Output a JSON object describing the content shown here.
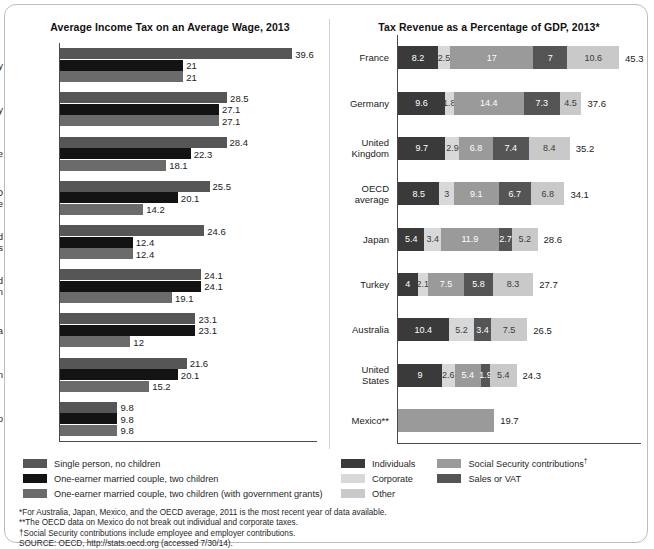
{
  "chart_data": [
    {
      "type": "bar",
      "title": "Average Income Tax on an Average Wage, 2013",
      "orientation": "horizontal",
      "xlabel": "",
      "ylabel": "",
      "xlim": [
        0,
        44
      ],
      "grid": false,
      "legend_position": "bottom-left",
      "categories": [
        "Germany",
        "Turkey",
        "France",
        "OECD\naverage",
        "United\nStates",
        "United\nKingdom",
        "Australia",
        "Japan",
        "Mexico"
      ],
      "series": [
        {
          "name": "Single person, no children",
          "color": "#565656",
          "values": [
            39.6,
            28.5,
            28.4,
            25.5,
            24.6,
            24.1,
            23.1,
            21.6,
            9.8
          ]
        },
        {
          "name": "One-earner married couple, two children",
          "color": "#131313",
          "values": [
            21,
            27.1,
            22.3,
            20.1,
            12.4,
            24.1,
            23.1,
            20.1,
            9.8
          ]
        },
        {
          "name": "One-earner married couple, two children (with government grants)",
          "color": "#6b6b6b",
          "values": [
            21,
            27.1,
            18.1,
            14.2,
            12.4,
            19.1,
            12,
            15.2,
            9.8
          ]
        }
      ],
      "value_labels": [
        [
          "39.6",
          "21",
          "21"
        ],
        [
          "28.5",
          "27.1",
          "27.1"
        ],
        [
          "28.4",
          "22.3",
          "18.1"
        ],
        [
          "25.5",
          "20.1",
          "14.2"
        ],
        [
          "24.6",
          "12.4",
          "12.4"
        ],
        [
          "24.1",
          "24.1",
          "19.1"
        ],
        [
          "23.1",
          "23.1",
          "12"
        ],
        [
          "21.6",
          "20.1",
          "15.2"
        ],
        [
          "9.8",
          "9.8",
          "9.8"
        ]
      ]
    },
    {
      "type": "bar",
      "subtype": "stacked",
      "title": "Tax Revenue as a Percentage of GDP, 2013*",
      "orientation": "horizontal",
      "xlabel": "",
      "ylabel": "",
      "xlim": [
        0,
        50
      ],
      "grid": false,
      "legend_position": "bottom-right",
      "categories": [
        "France",
        "Germany",
        "United\nKingdom",
        "OECD\naverage",
        "Japan",
        "Turkey",
        "Australia",
        "United\nStates",
        "Mexico**"
      ],
      "series": [
        {
          "name": "Individuals",
          "color": "#3a3a3a",
          "values": [
            8.2,
            9.6,
            9.7,
            8.5,
            5.4,
            4,
            10.4,
            9,
            null
          ]
        },
        {
          "name": "Corporate",
          "color": "#d8d8d8",
          "values": [
            2.5,
            1.8,
            2.9,
            3,
            3.4,
            2.1,
            5.2,
            2.6,
            null
          ]
        },
        {
          "name": "Social Security contributions",
          "color": "#9a9a9a",
          "values": [
            17,
            14.4,
            6.8,
            9.1,
            11.9,
            7.5,
            null,
            5.4,
            19.7
          ]
        },
        {
          "name": "Sales or VAT",
          "color": "#555555",
          "values": [
            7,
            7.3,
            7.4,
            6.7,
            2.7,
            5.8,
            3.4,
            1.9,
            null
          ]
        },
        {
          "name": "Other",
          "color": "#c9c9c9",
          "values": [
            10.6,
            4.5,
            8.4,
            6.8,
            5.2,
            8.3,
            7.5,
            5.4,
            null
          ]
        }
      ],
      "rows": [
        {
          "label": "France",
          "total": "45.3",
          "segments": [
            {
              "series": "Individuals",
              "value": 8.2,
              "label": "8.2",
              "color": "#3a3a3a",
              "text": "light"
            },
            {
              "series": "Corporate",
              "value": 2.5,
              "label": "2.5",
              "color": "#d8d8d8",
              "text": "dark"
            },
            {
              "series": "Social Security contributions",
              "value": 17,
              "label": "17",
              "color": "#9a9a9a",
              "text": "light"
            },
            {
              "series": "Sales or VAT",
              "value": 7,
              "label": "7",
              "color": "#555555",
              "text": "light"
            },
            {
              "series": "Other",
              "value": 10.6,
              "label": "10.6",
              "color": "#c9c9c9",
              "text": "dark"
            }
          ]
        },
        {
          "label": "Germany",
          "total": "37.6",
          "segments": [
            {
              "series": "Individuals",
              "value": 9.6,
              "label": "9.6",
              "color": "#3a3a3a",
              "text": "light"
            },
            {
              "series": "Corporate",
              "value": 1.8,
              "label": "1.8",
              "color": "#d8d8d8",
              "text": "dark"
            },
            {
              "series": "Social Security contributions",
              "value": 14.4,
              "label": "14.4",
              "color": "#9a9a9a",
              "text": "light"
            },
            {
              "series": "Sales or VAT",
              "value": 7.3,
              "label": "7.3",
              "color": "#555555",
              "text": "light"
            },
            {
              "series": "Other",
              "value": 4.5,
              "label": "4.5",
              "color": "#c9c9c9",
              "text": "dark"
            }
          ]
        },
        {
          "label": "United\nKingdom",
          "total": "35.2",
          "segments": [
            {
              "series": "Individuals",
              "value": 9.7,
              "label": "9.7",
              "color": "#3a3a3a",
              "text": "light"
            },
            {
              "series": "Corporate",
              "value": 2.9,
              "label": "2.9",
              "color": "#d8d8d8",
              "text": "dark"
            },
            {
              "series": "Social Security contributions",
              "value": 6.8,
              "label": "6.8",
              "color": "#9a9a9a",
              "text": "light"
            },
            {
              "series": "Sales or VAT",
              "value": 7.4,
              "label": "7.4",
              "color": "#555555",
              "text": "light"
            },
            {
              "series": "Other",
              "value": 8.4,
              "label": "8.4",
              "color": "#c9c9c9",
              "text": "dark"
            }
          ]
        },
        {
          "label": "OECD\naverage",
          "total": "34.1",
          "segments": [
            {
              "series": "Individuals",
              "value": 8.5,
              "label": "8.5",
              "color": "#3a3a3a",
              "text": "light"
            },
            {
              "series": "Corporate",
              "value": 3,
              "label": "3",
              "color": "#d8d8d8",
              "text": "dark"
            },
            {
              "series": "Social Security contributions",
              "value": 9.1,
              "label": "9.1",
              "color": "#9a9a9a",
              "text": "light"
            },
            {
              "series": "Sales or VAT",
              "value": 6.7,
              "label": "6.7",
              "color": "#555555",
              "text": "light"
            },
            {
              "series": "Other",
              "value": 6.8,
              "label": "6.8",
              "color": "#c9c9c9",
              "text": "dark"
            }
          ]
        },
        {
          "label": "Japan",
          "total": "28.6",
          "segments": [
            {
              "series": "Individuals",
              "value": 5.4,
              "label": "5.4",
              "color": "#3a3a3a",
              "text": "light"
            },
            {
              "series": "Corporate",
              "value": 3.4,
              "label": "3.4",
              "color": "#d8d8d8",
              "text": "dark"
            },
            {
              "series": "Social Security contributions",
              "value": 11.9,
              "label": "11.9",
              "color": "#9a9a9a",
              "text": "light"
            },
            {
              "series": "Sales or VAT",
              "value": 2.7,
              "label": "2.7",
              "color": "#555555",
              "text": "light"
            },
            {
              "series": "Other",
              "value": 5.2,
              "label": "5.2",
              "color": "#c9c9c9",
              "text": "dark"
            }
          ]
        },
        {
          "label": "Turkey",
          "total": "27.7",
          "segments": [
            {
              "series": "Individuals",
              "value": 4,
              "label": "4",
              "color": "#3a3a3a",
              "text": "light"
            },
            {
              "series": "Corporate",
              "value": 2.1,
              "label": "2.1",
              "color": "#d8d8d8",
              "text": "dark"
            },
            {
              "series": "Social Security contributions",
              "value": 7.5,
              "label": "7.5",
              "color": "#9a9a9a",
              "text": "light"
            },
            {
              "series": "Sales or VAT",
              "value": 5.8,
              "label": "5.8",
              "color": "#555555",
              "text": "light"
            },
            {
              "series": "Other",
              "value": 8.3,
              "label": "8.3",
              "color": "#c9c9c9",
              "text": "dark"
            }
          ]
        },
        {
          "label": "Australia",
          "total": "26.5",
          "segments": [
            {
              "series": "Individuals",
              "value": 10.4,
              "label": "10.4",
              "color": "#3a3a3a",
              "text": "light"
            },
            {
              "series": "Corporate",
              "value": 5.2,
              "label": "5.2",
              "color": "#d8d8d8",
              "text": "dark"
            },
            {
              "series": "Sales or VAT",
              "value": 3.4,
              "label": "3.4",
              "color": "#555555",
              "text": "light"
            },
            {
              "series": "Other",
              "value": 7.5,
              "label": "7.5",
              "color": "#c9c9c9",
              "text": "dark"
            }
          ]
        },
        {
          "label": "United\nStates",
          "total": "24.3",
          "segments": [
            {
              "series": "Individuals",
              "value": 9,
              "label": "9",
              "color": "#3a3a3a",
              "text": "light"
            },
            {
              "series": "Corporate",
              "value": 2.6,
              "label": "2.6",
              "color": "#d8d8d8",
              "text": "dark"
            },
            {
              "series": "Social Security contributions",
              "value": 5.4,
              "label": "5.4",
              "color": "#9a9a9a",
              "text": "light"
            },
            {
              "series": "Sales or VAT",
              "value": 1.9,
              "label": "1.9",
              "color": "#555555",
              "text": "light"
            },
            {
              "series": "Other",
              "value": 5.4,
              "label": "5.4",
              "color": "#c9c9c9",
              "text": "dark"
            }
          ]
        },
        {
          "label": "Mexico**",
          "total": "19.7",
          "segments": [
            {
              "series": "Social Security contributions",
              "value": 19.7,
              "label": "",
              "color": "#9a9a9a",
              "text": "light"
            }
          ]
        }
      ]
    }
  ],
  "legend_left": {
    "items": [
      {
        "label": "Single person, no children",
        "color": "#565656"
      },
      {
        "label": "One-earner married couple, two children",
        "color": "#131313"
      },
      {
        "label": "One-earner married couple, two children (with government grants)",
        "color": "#6b6b6b"
      }
    ]
  },
  "legend_right": {
    "column1": [
      {
        "label": "Individuals",
        "color": "#3a3a3a"
      },
      {
        "label": "Corporate",
        "color": "#d8d8d8"
      },
      {
        "label": "Other",
        "color": "#c9c9c9"
      }
    ],
    "column2": [
      {
        "label": "Social Security contributions",
        "sup": "†",
        "color": "#9a9a9a"
      },
      {
        "label": "Sales or VAT",
        "sup": "",
        "color": "#555555"
      }
    ]
  },
  "notes": [
    "*For Australia, Japan, Mexico, and the OECD average, 2011 is the most recent year of data available.",
    "**The OECD data on Mexico do not break out individual and corporate taxes.",
    "†Social Security contributions include employee and employer contributions.",
    "SOURCE: OECD, http://stats.oecd.org (accessed 7/30/14)."
  ]
}
